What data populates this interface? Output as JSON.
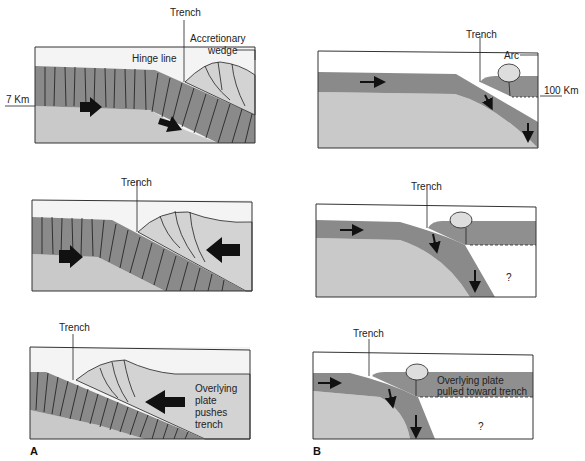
{
  "figure": {
    "panel_a": {
      "label": "A",
      "top": {
        "trench": "Trench",
        "hinge": "Hinge line",
        "wedge_1": "Accretionary",
        "wedge_2": "wedge",
        "depth": "7 Km"
      },
      "middle": {
        "trench": "Trench"
      },
      "bottom": {
        "trench": "Trench",
        "note_1": "Overlying",
        "note_2": "plate",
        "note_3": "pushes",
        "note_4": "trench"
      }
    },
    "panel_b": {
      "label": "B",
      "top": {
        "trench": "Trench",
        "arc": "Arc",
        "depth": "100 Km"
      },
      "middle": {
        "trench": "Trench",
        "unknown": "?"
      },
      "bottom": {
        "trench": "Trench",
        "note_1": "Overlying plate",
        "note_2": "pulled toward trench",
        "unknown": "?"
      }
    }
  },
  "colors": {
    "sky": "#f4f4f4",
    "mantle": "#c9c9c9",
    "slab": "#8a8a8a",
    "wedge": "#d3d3d3"
  }
}
